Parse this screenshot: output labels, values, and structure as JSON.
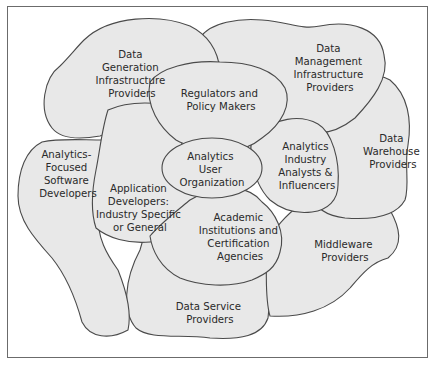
{
  "diagram": {
    "type": "overlapping-blob-ecosystem",
    "colors": {
      "blob_fill": "#e8e8e8",
      "blob_stroke": "#4a4a4a",
      "text": "#2a2a2a",
      "frame": "#6b6b6b"
    },
    "nodes": [
      {
        "id": "data-generation",
        "lines": [
          "Data",
          "Generation",
          "Infrastructure",
          "Providers"
        ]
      },
      {
        "id": "data-management",
        "lines": [
          "Data",
          "Management",
          "Infrastructure",
          "Providers"
        ]
      },
      {
        "id": "data-warehouse",
        "lines": [
          "Data",
          "Warehouse",
          "Providers"
        ]
      },
      {
        "id": "middleware",
        "lines": [
          "Middleware",
          "Providers"
        ]
      },
      {
        "id": "data-service",
        "lines": [
          "Data Service",
          "Providers"
        ]
      },
      {
        "id": "analytics-software",
        "lines": [
          "Analytics-",
          "Focused",
          "Software",
          "Developers"
        ]
      },
      {
        "id": "application-developers",
        "lines": [
          "Application",
          "Developers:",
          "Industry Specific",
          "or General"
        ]
      },
      {
        "id": "academic",
        "lines": [
          "Academic",
          "Institutions and",
          "Certification",
          "Agencies"
        ]
      },
      {
        "id": "analysts",
        "lines": [
          "Analytics",
          "Industry",
          "Analysts &",
          "Influencers"
        ]
      },
      {
        "id": "regulators",
        "lines": [
          "Regulators and",
          "Policy Makers"
        ]
      },
      {
        "id": "user-org",
        "lines": [
          "Analytics",
          "User",
          "Organization"
        ]
      }
    ]
  }
}
